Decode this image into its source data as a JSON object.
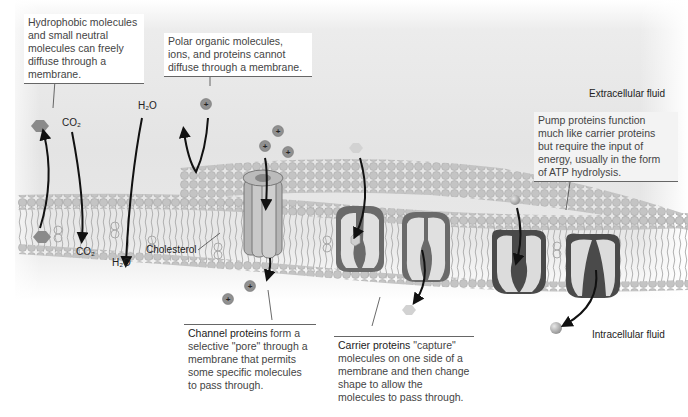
{
  "callouts": {
    "hydrophobic": {
      "lines": [
        "Hydrophobic molecules",
        "and small neutral",
        "molecules can freely",
        "diffuse through a",
        "membrane."
      ]
    },
    "polar": {
      "lines": [
        "Polar organic molecules,",
        "ions, and proteins cannot",
        "diffuse through a membrane."
      ]
    },
    "pump": {
      "lines": [
        "Pump proteins function",
        "much like carrier proteins",
        "but require the input of",
        "energy, usually in the form",
        "of ATP hydrolysis."
      ]
    },
    "channel": {
      "bold": "Channel proteins",
      "lines": [
        " form a",
        "selective \"pore\" through a",
        "membrane that permits",
        "some specific molecules",
        "to pass through."
      ]
    },
    "carrier": {
      "bold": "Carrier proteins",
      "lines": [
        " \"capture\"",
        "molecules on one side of a",
        "membrane and then change",
        "shape to allow the",
        "molecules to pass through."
      ]
    }
  },
  "labels": {
    "co2_top": "CO₂",
    "co2_bottom": "CO₂",
    "h2o_top": "H₂O",
    "h2o_bottom": "H₂O",
    "cholesterol": "Cholesterol",
    "extracellular": "Extracellular fluid",
    "intracellular": "Intracellular fluid",
    "ion_sign": "+"
  },
  "colors": {
    "molecule_dark": "#8a8a8a",
    "molecule_light": "#c8c8c8",
    "lipid_head": "#bdbdbd",
    "protein_dark": "#5a5a5a",
    "protein_light": "#d9d9d9",
    "arrow": "#111111"
  }
}
